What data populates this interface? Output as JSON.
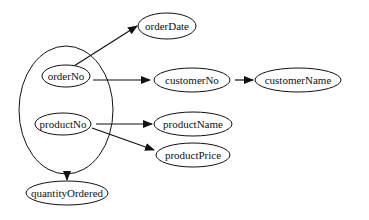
{
  "diagram": {
    "type": "functional-dependency",
    "colors": {
      "stroke": "#111111",
      "background": "#ffffff"
    },
    "composite": {
      "id": "composite-key",
      "members": [
        "orderNo",
        "productNo"
      ]
    },
    "nodes": [
      {
        "id": "orderNo",
        "label": "orderNo"
      },
      {
        "id": "productNo",
        "label": "productNo"
      },
      {
        "id": "orderDate",
        "label": "orderDate"
      },
      {
        "id": "customerNo",
        "label": "customerNo"
      },
      {
        "id": "customerName",
        "label": "customerName"
      },
      {
        "id": "productName",
        "label": "productName"
      },
      {
        "id": "productPrice",
        "label": "productPrice"
      },
      {
        "id": "quantityOrdered",
        "label": "quantityOrdered"
      }
    ],
    "edges": [
      {
        "from": "orderNo",
        "to": "orderDate"
      },
      {
        "from": "orderNo",
        "to": "customerNo"
      },
      {
        "from": "customerNo",
        "to": "customerName"
      },
      {
        "from": "productNo",
        "to": "productName"
      },
      {
        "from": "productNo",
        "to": "productPrice"
      },
      {
        "from": "composite-key",
        "to": "quantityOrdered"
      }
    ]
  }
}
